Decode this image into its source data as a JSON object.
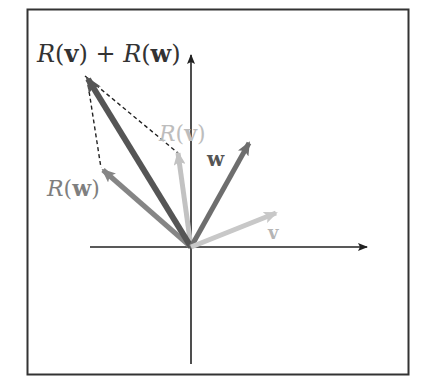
{
  "diagram": {
    "frame": {
      "x": 27,
      "y": 9,
      "width": 382,
      "height": 366,
      "color": "#333333"
    },
    "origin": {
      "x": 191,
      "y": 247
    },
    "axes": {
      "x": {
        "from": 90,
        "to": 367,
        "color": "#222222"
      },
      "y": {
        "from": 364,
        "to": 55,
        "color": "#222222"
      }
    },
    "vectors": [
      {
        "id": "v",
        "label": "v",
        "tip": {
          "x": 276,
          "y": 213
        },
        "color": "#c8c8c8",
        "width": 5
      },
      {
        "id": "w",
        "label": "w",
        "tip": {
          "x": 249,
          "y": 143
        },
        "color": "#6e6e6e",
        "width": 5
      },
      {
        "id": "Rv",
        "label": "R(v)",
        "tip": {
          "x": 178,
          "y": 153
        },
        "color": "#c2c2c2",
        "width": 5
      },
      {
        "id": "Rw",
        "label": "R(w)",
        "tip": {
          "x": 103,
          "y": 170
        },
        "color": "#858585",
        "width": 5
      },
      {
        "id": "RvRw",
        "label": "R(v) + R(w)",
        "tip": {
          "x": 88,
          "y": 79
        },
        "color": "#555555",
        "width": 6
      }
    ],
    "dashed_lines": [
      {
        "from": {
          "x": 85,
          "y": 76
        },
        "to": {
          "x": 178,
          "y": 153
        }
      },
      {
        "from": {
          "x": 87,
          "y": 78
        },
        "to": {
          "x": 101,
          "y": 168
        }
      }
    ],
    "labels": {
      "sum": {
        "text_R1": "R",
        "text_v": "v",
        "text_plus": "+",
        "text_R2": "R",
        "text_w": "w",
        "color": "#333333"
      },
      "Rv": {
        "text_R": "R",
        "text_v": "v",
        "color": "#bdbdbd"
      },
      "Rw": {
        "text_R": "R",
        "text_w": "w",
        "color": "#7f7f7f"
      },
      "w": {
        "text": "w",
        "color": "#555555"
      },
      "v": {
        "text": "v",
        "color": "#b5b5b5"
      }
    }
  }
}
